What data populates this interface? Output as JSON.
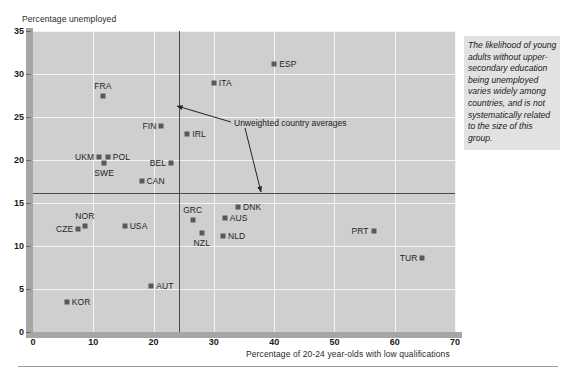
{
  "chart_data": {
    "type": "scatter",
    "title": "",
    "xlabel": "Percentage of 20-24 year-olds with low qualifications",
    "ylabel": "Percentage unemployed",
    "xlim": [
      0,
      70
    ],
    "ylim": [
      0,
      35
    ],
    "xticks": [
      0,
      10,
      20,
      30,
      40,
      50,
      60,
      70
    ],
    "yticks": [
      0,
      5,
      10,
      15,
      20,
      25,
      30,
      35
    ],
    "grid": true,
    "legend_position": "none",
    "annotations": [
      {
        "text": "Unweighted country averages",
        "x_value": 33.5,
        "y_value": 25.6,
        "points_to": [
          "vertical average line x=24.3",
          "horizontal average line y=16.2"
        ]
      }
    ],
    "reference_lines": [
      {
        "orientation": "vertical",
        "value": 24.3,
        "label": "Unweighted country average x"
      },
      {
        "orientation": "horizontal",
        "value": 16.2,
        "label": "Unweighted country average y"
      }
    ],
    "points": [
      {
        "label": "ESP",
        "x": 40.0,
        "y": 31.2,
        "label_pos": "right"
      },
      {
        "label": "ITA",
        "x": 30.0,
        "y": 29.0,
        "label_pos": "right"
      },
      {
        "label": "FRA",
        "x": 11.6,
        "y": 27.4,
        "label_pos": "above"
      },
      {
        "label": "FIN",
        "x": 21.3,
        "y": 24.0,
        "label_pos": "left"
      },
      {
        "label": "IRL",
        "x": 25.6,
        "y": 23.0,
        "label_pos": "right"
      },
      {
        "label": "UKM",
        "x": 11.0,
        "y": 20.4,
        "label_pos": "left"
      },
      {
        "label": "POL",
        "x": 12.4,
        "y": 20.4,
        "label_pos": "right"
      },
      {
        "label": "SWE",
        "x": 11.8,
        "y": 19.7,
        "label_pos": "below"
      },
      {
        "label": "BEL",
        "x": 22.9,
        "y": 19.6,
        "label_pos": "left"
      },
      {
        "label": "CAN",
        "x": 18.0,
        "y": 17.6,
        "label_pos": "right"
      },
      {
        "label": "DNK",
        "x": 34.0,
        "y": 14.5,
        "label_pos": "right"
      },
      {
        "label": "GRC",
        "x": 26.5,
        "y": 13.0,
        "label_pos": "above"
      },
      {
        "label": "AUS",
        "x": 31.8,
        "y": 13.2,
        "label_pos": "right"
      },
      {
        "label": "NOR",
        "x": 8.6,
        "y": 12.3,
        "label_pos": "above"
      },
      {
        "label": "USA",
        "x": 15.2,
        "y": 12.3,
        "label_pos": "right"
      },
      {
        "label": "CZE",
        "x": 7.5,
        "y": 12.0,
        "label_pos": "left"
      },
      {
        "label": "NZL",
        "x": 28.0,
        "y": 11.5,
        "label_pos": "below"
      },
      {
        "label": "NLD",
        "x": 31.5,
        "y": 11.2,
        "label_pos": "right"
      },
      {
        "label": "PRT",
        "x": 56.5,
        "y": 11.7,
        "label_pos": "left"
      },
      {
        "label": "TUR",
        "x": 64.6,
        "y": 8.6,
        "label_pos": "left"
      },
      {
        "label": "AUT",
        "x": 19.6,
        "y": 5.4,
        "label_pos": "right"
      },
      {
        "label": "KOR",
        "x": 5.6,
        "y": 3.5,
        "label_pos": "right"
      }
    ]
  },
  "side_note": {
    "text": "The likelihood of young adults without upper-secondary education being unemployed varies widely among countries, and is not systematically related to the size of this group."
  },
  "colors": {
    "plot_background": "#cfcfcf",
    "gridline": "#f3f3f3",
    "axis_band": "#a6a6a6",
    "marker": "#595959",
    "reference_line": "#4a4a4a",
    "side_note_background": "#e2e2e2"
  }
}
